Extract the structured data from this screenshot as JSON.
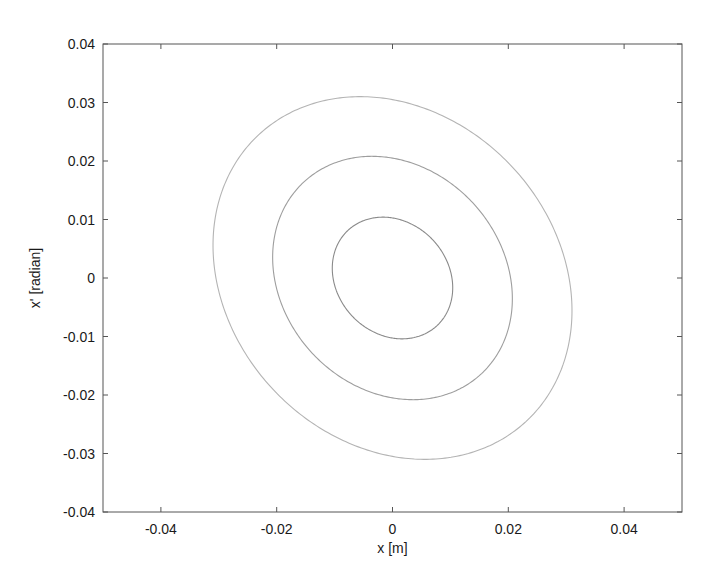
{
  "chart_data": {
    "type": "line",
    "title": "",
    "xlabel": "x [m]",
    "ylabel": "x' [radian]",
    "xlim": [
      -0.05,
      0.05
    ],
    "ylim": [
      -0.04,
      0.04
    ],
    "xticks": [
      -0.04,
      -0.02,
      0,
      0.02,
      0.04
    ],
    "xtick_labels": [
      "-0.04",
      "-0.02",
      "0",
      "0.02",
      "0.04"
    ],
    "yticks": [
      -0.04,
      -0.03,
      -0.02,
      -0.01,
      0,
      0.01,
      0.02,
      0.03,
      0.04
    ],
    "ytick_labels": [
      "-0.04",
      "-0.03",
      "-0.02",
      "-0.01",
      "0",
      "0.01",
      "0.02",
      "0.03",
      "0.04"
    ],
    "grid": false,
    "legend": null,
    "box": true,
    "series": [
      {
        "name": "ellipse-inner",
        "shape": "ellipse",
        "x_max": 0.0104,
        "xp_max": 0.0104,
        "correlation": 0.16,
        "approx_points": {
          "top": [
            -0.0014,
            0.0102
          ],
          "bottom": [
            0.002,
            -0.0108
          ],
          "left": [
            -0.0102,
            0.0015
          ],
          "right": [
            0.0105,
            -0.0018
          ]
        },
        "color": "#8a8a8a"
      },
      {
        "name": "ellipse-middle",
        "shape": "ellipse",
        "x_max": 0.0207,
        "xp_max": 0.0208,
        "correlation": 0.17,
        "approx_points": {
          "top": [
            -0.0036,
            0.0204
          ],
          "bottom": [
            0.0038,
            -0.0212
          ],
          "left": [
            -0.0202,
            0.004
          ],
          "right": [
            0.0207,
            -0.0052
          ]
        },
        "color": "#9e9e9e"
      },
      {
        "name": "ellipse-outer",
        "shape": "ellipse",
        "x_max": 0.031,
        "xp_max": 0.031,
        "correlation": 0.18,
        "approx_points": {
          "top": [
            -0.0054,
            0.0309
          ],
          "bottom": [
            0.0055,
            -0.0313
          ],
          "left": [
            -0.0304,
            0.0045
          ],
          "right": [
            0.031,
            -0.0062
          ]
        },
        "color": "#b4b4b4"
      }
    ]
  },
  "plot_area_px": {
    "left": 103,
    "top": 44,
    "right": 682,
    "bottom": 512
  },
  "colors": {
    "axes": "#555555",
    "text": "#1a1a1a",
    "background": "#ffffff"
  }
}
